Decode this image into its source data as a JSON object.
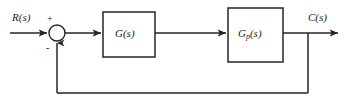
{
  "diagram": {
    "type": "control-system-block-diagram",
    "background_color": "#ffffff",
    "line_color": "#262626",
    "text_color": "#1a1a1a",
    "width": 346,
    "height": 108
  },
  "signals": {
    "input_label": "R(s)",
    "output_label": "C(s)"
  },
  "summing_junction": {
    "name": "summing-junction",
    "positive_sign": "+",
    "negative_sign": "-",
    "cx": 57,
    "cy": 33,
    "r": 8
  },
  "blocks": [
    {
      "id": "controller",
      "label_main": "G",
      "label_sub": "",
      "label_arg": "(s)",
      "label_full": "G(s)",
      "x": 103,
      "y": 12,
      "w": 52,
      "h": 45
    },
    {
      "id": "plant",
      "label_main": "G",
      "label_sub": "p",
      "label_arg": "(s)",
      "label_full": "Gp(s)",
      "x": 228,
      "y": 8,
      "w": 55,
      "h": 54
    }
  ],
  "feedback": {
    "name": "unity-feedback-path",
    "takeoff_x": 308,
    "bottom_y": 93,
    "return_x": 57,
    "has_block": false
  }
}
